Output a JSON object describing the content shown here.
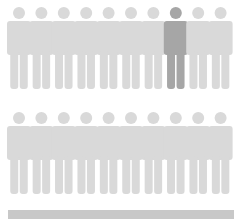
{
  "colors": {
    "inactive": "#d9d9d9",
    "highlight": "#a6a6a6",
    "bar": "#c8c8c8",
    "background": "#ffffff"
  },
  "figure": {
    "spacing": 22.4,
    "head_r": 6,
    "head_cy": 13,
    "body_top": 21,
    "body_h": 34,
    "body_w": 24,
    "leg_w": 8,
    "leg_gap": 1.5,
    "leg_bottom": 89
  },
  "rows": [
    {
      "name": "row-top",
      "top": 0,
      "count": 10,
      "highlighted": [
        7
      ]
    },
    {
      "name": "row-bottom",
      "top": 105,
      "count": 10,
      "highlighted": []
    }
  ],
  "bar": {
    "left": 8,
    "top": 210,
    "width": 226,
    "height": 9
  }
}
